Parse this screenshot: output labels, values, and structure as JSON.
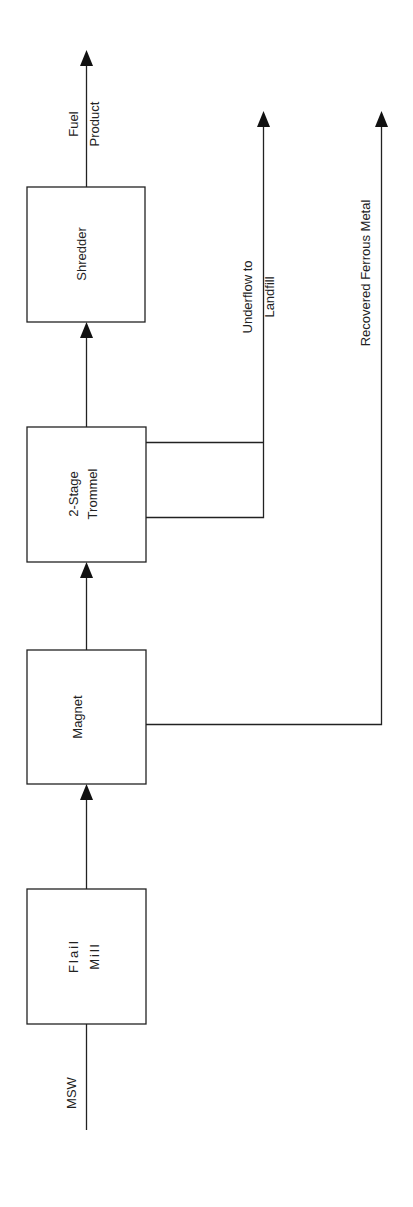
{
  "diagram": {
    "type": "process-flow",
    "orientation": "rotated-90-ccw",
    "colors": {
      "stroke": "#222222",
      "background": "#ffffff"
    },
    "nodes": [
      {
        "id": "flail_mill",
        "line1": "Flail",
        "line2": "Mill"
      },
      {
        "id": "magnet",
        "line1": "Magnet"
      },
      {
        "id": "trommel",
        "line1": "2-Stage",
        "line2": "Trommel"
      },
      {
        "id": "shredder",
        "line1": "Shredder"
      }
    ],
    "streams": {
      "input": {
        "label": "MSW"
      },
      "fuel": {
        "line1": "Fuel",
        "line2": "Product"
      },
      "underflow": {
        "line1": "Underflow to",
        "line2": "Landfill"
      },
      "ferrous": {
        "label": "Recovered Ferrous Metal"
      }
    },
    "edges": [
      {
        "from": "MSW",
        "to": "flail_mill"
      },
      {
        "from": "flail_mill",
        "to": "magnet"
      },
      {
        "from": "magnet",
        "to": "trommel"
      },
      {
        "from": "trommel",
        "to": "shredder"
      },
      {
        "from": "shredder",
        "to": "Fuel Product"
      },
      {
        "from": "trommel",
        "to": "Underflow to Landfill"
      },
      {
        "from": "magnet",
        "to": "Recovered Ferrous Metal"
      }
    ]
  }
}
